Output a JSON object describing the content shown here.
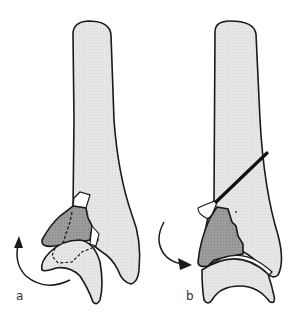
{
  "figure": {
    "panels": [
      {
        "id": "a",
        "label": "a"
      },
      {
        "id": "b",
        "label": "b"
      }
    ]
  },
  "colors": {
    "bone_fill": "#e8e8e8",
    "fragment_fill": "#9a9a9a",
    "outline": "#1a1a1a",
    "background": "#ffffff",
    "gap_fill": "#ffffff"
  }
}
